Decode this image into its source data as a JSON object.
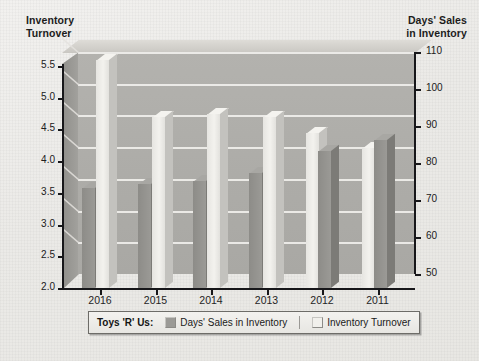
{
  "chart_data": {
    "type": "bar",
    "title": "",
    "subtitle": "",
    "categories": [
      "2016",
      "2015",
      "2014",
      "2013",
      "2012",
      "2011"
    ],
    "series": [
      {
        "name": "Days' Sales in Inventory",
        "axis": "right",
        "values": [
          77,
          78,
          79,
          81,
          87,
          90
        ],
        "color": "#8d8c88"
      },
      {
        "name": "Inventory Turnover",
        "axis": "left",
        "values": [
          5.6,
          4.7,
          4.75,
          4.7,
          4.45,
          4.2
        ],
        "color": "#eeedea"
      }
    ],
    "left_axis": {
      "label": "Inventory Turnover",
      "ticks": [
        "5.5",
        "5.0",
        "4.5",
        "4.0",
        "3.5",
        "3.0",
        "2.5",
        "2.0"
      ],
      "min": 2.0,
      "max": 5.5
    },
    "right_axis": {
      "label": "Days' Sales in Inventory",
      "ticks": [
        "110",
        "100",
        "90",
        "80",
        "70",
        "60",
        "50"
      ],
      "min": 50,
      "max": 110
    },
    "xlabel": "",
    "grid": true,
    "legend_position": "bottom"
  },
  "left_axis_title": "Inventory\nTurnover",
  "left_axis_title_line1": "Inventory",
  "left_axis_title_line2": "Turnover",
  "right_axis_title_line1": "Days' Sales",
  "right_axis_title_line2": "in Inventory",
  "legend": {
    "title": "Toys 'R' Us:",
    "items": [
      {
        "label": "Days' Sales in Inventory",
        "swatch": "#9b9a96"
      },
      {
        "label": "Inventory Turnover",
        "swatch": "#f1f0ec"
      }
    ]
  }
}
